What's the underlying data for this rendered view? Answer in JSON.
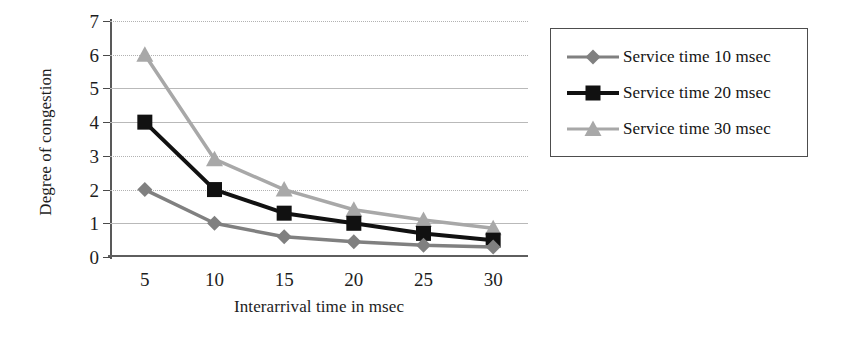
{
  "chart_data": {
    "type": "line",
    "title": "",
    "xlabel": "Interarrival time in msec",
    "ylabel": "Degree of congestion",
    "x": [
      5,
      10,
      15,
      20,
      25,
      30
    ],
    "xticklabels": [
      "5",
      "10",
      "15",
      "20",
      "25",
      "30"
    ],
    "yticklabels": [
      "0",
      "1",
      "2",
      "3",
      "4",
      "5",
      "6",
      "7"
    ],
    "xlim": [
      2.5,
      32.5
    ],
    "ylim": [
      0,
      7
    ],
    "grid": true,
    "legend_position": "right-outside",
    "series": [
      {
        "name": "Service time 10 msec",
        "values": [
          2.0,
          1.0,
          0.6,
          0.45,
          0.35,
          0.3
        ],
        "color": "#808080",
        "marker": "diamond"
      },
      {
        "name": "Service time 20 msec",
        "values": [
          4.0,
          2.0,
          1.3,
          1.0,
          0.7,
          0.5
        ],
        "color": "#111111",
        "marker": "square"
      },
      {
        "name": "Service time 30 msec",
        "values": [
          6.0,
          2.9,
          2.0,
          1.4,
          1.1,
          0.85
        ],
        "color": "#a8a8a8",
        "marker": "triangle"
      }
    ]
  },
  "axes": {
    "y_title": "Degree of congestion",
    "x_title": "Interarrival time in msec",
    "y_ticks": [
      "7",
      "6",
      "5",
      "4",
      "3",
      "2",
      "1",
      "0"
    ],
    "x_ticks": [
      "5",
      "10",
      "15",
      "20",
      "25",
      "30"
    ]
  },
  "legend": {
    "items": [
      {
        "label": "Service time 10 msec",
        "marker": "diamond-marker",
        "color": "#808080"
      },
      {
        "label": "Service time 20 msec",
        "marker": "square-marker",
        "color": "#111111"
      },
      {
        "label": "Service time 30 msec",
        "marker": "triangle-marker",
        "color": "#a8a8a8"
      }
    ]
  }
}
